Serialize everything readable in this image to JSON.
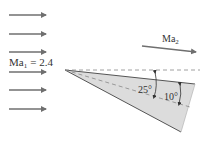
{
  "figure": {
    "upstream_label": "Ma",
    "upstream_sub": "1",
    "upstream_value": "= 2.4",
    "downstream_label": "Ma",
    "downstream_sub": "2",
    "angle_upper": "25°",
    "angle_lower": "10°",
    "colors": {
      "arrow": "#6f6f6f",
      "wedge_fill": "#dcdcdc",
      "line": "#555555",
      "dashed": "#888888"
    }
  }
}
